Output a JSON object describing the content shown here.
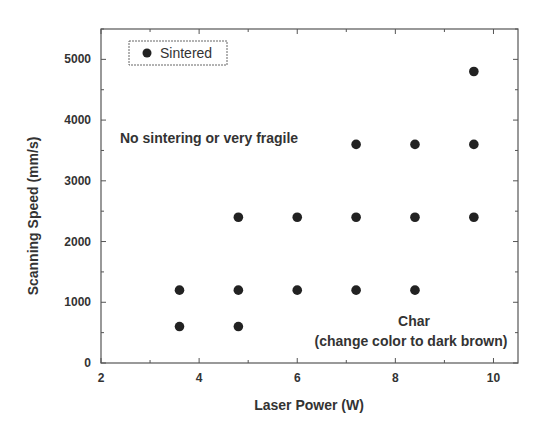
{
  "chart_data": {
    "type": "scatter",
    "title": "",
    "xlabel": "Laser Power (W)",
    "ylabel": "Scanning Speed (mm/s)",
    "xlim": [
      2,
      10.5
    ],
    "ylim": [
      0,
      5500
    ],
    "xticks": [
      2,
      4,
      6,
      8,
      10
    ],
    "yticks": [
      0,
      1000,
      2000,
      3000,
      4000,
      5000
    ],
    "grid": false,
    "legend_position": "upper left",
    "series": [
      {
        "name": "Sintered",
        "marker": "filled-circle",
        "color": "#222222",
        "points": [
          {
            "x": 3.6,
            "y": 600
          },
          {
            "x": 3.6,
            "y": 1200
          },
          {
            "x": 4.8,
            "y": 600
          },
          {
            "x": 4.8,
            "y": 1200
          },
          {
            "x": 4.8,
            "y": 2400
          },
          {
            "x": 6.0,
            "y": 1200
          },
          {
            "x": 6.0,
            "y": 2400
          },
          {
            "x": 7.2,
            "y": 1200
          },
          {
            "x": 7.2,
            "y": 2400
          },
          {
            "x": 7.2,
            "y": 3600
          },
          {
            "x": 8.4,
            "y": 1200
          },
          {
            "x": 8.4,
            "y": 2400
          },
          {
            "x": 8.4,
            "y": 3600
          },
          {
            "x": 9.6,
            "y": 2400
          },
          {
            "x": 9.6,
            "y": 3600
          },
          {
            "x": 9.6,
            "y": 4800
          }
        ]
      }
    ],
    "annotations": [
      {
        "text": "No sintering or very fragile",
        "x": 3.0,
        "y": 3700
      },
      {
        "text": "Char",
        "x": 8.55,
        "y": 650
      },
      {
        "text": "(change color to dark brown)",
        "x": 8.55,
        "y": 300
      }
    ]
  },
  "legend": {
    "label": "Sintered"
  },
  "labels": {
    "xlabel": "Laser Power (W)",
    "ylabel": "Scanning Speed (mm/s)",
    "region_top": "No sintering or very fragile",
    "region_bottom_1": "Char",
    "region_bottom_2": "(change color to dark brown)"
  }
}
